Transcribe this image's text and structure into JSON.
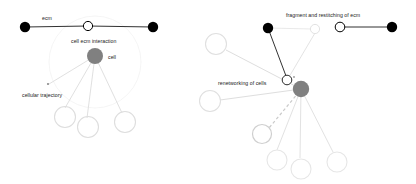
{
  "figure": {
    "title": "",
    "background_color": "#ffffff",
    "panels": [
      {
        "id": "left-panel",
        "name": "cell-ecm-interaction-panel",
        "labels": {
          "ecm": "ecm",
          "cell_ecm_interaction": "cell ecm interaction",
          "cell": "cell",
          "cellular_trajectory": "cellular trajectory"
        },
        "colors": {
          "ecm_node_filled": "#000000",
          "ecm_node_open": "#ffffff",
          "ecm_node_stroke": "#000000",
          "cell_node": "#808080",
          "trajectory_line": "#d8d8d8",
          "trajectory_node": "#d8d8d8",
          "halo": "#f0f0f0",
          "ecm_link": "#1a1a1a"
        },
        "nodes": {
          "ecm_left": {
            "x": 25,
            "y": 27,
            "r": 5.2,
            "type": "filled"
          },
          "ecm_mid": {
            "x": 88,
            "y": 26,
            "r": 4.6,
            "type": "open"
          },
          "ecm_right": {
            "x": 153,
            "y": 27,
            "r": 5.2,
            "type": "filled"
          },
          "cell": {
            "x": 95,
            "y": 56,
            "r": 8.0,
            "type": "cell"
          },
          "traj_1": {
            "x": 49,
            "y": 84,
            "r": 1.2,
            "type": "tiny"
          },
          "traj_2": {
            "x": 65,
            "y": 117,
            "r": 10.5,
            "type": "open-faint"
          },
          "traj_3": {
            "x": 87,
            "y": 127,
            "r": 10.5,
            "type": "open-faint"
          },
          "traj_4": {
            "x": 124,
            "y": 122,
            "r": 10.5,
            "type": "open-faint"
          }
        },
        "halo": {
          "x": 95,
          "y": 62,
          "r": 46
        },
        "edges": [
          {
            "from": "ecm_left",
            "to": "ecm_mid",
            "style": "solid-dark"
          },
          {
            "from": "ecm_mid",
            "to": "ecm_right",
            "style": "solid-dark"
          },
          {
            "from": "cell",
            "to": "traj_1",
            "style": "solid-faint"
          },
          {
            "from": "cell",
            "to": "traj_2",
            "style": "solid-faint"
          },
          {
            "from": "cell",
            "to": "traj_3",
            "style": "solid-faint"
          },
          {
            "from": "cell",
            "to": "traj_4",
            "style": "solid-faint"
          }
        ]
      },
      {
        "id": "right-panel",
        "name": "ecm-fragmentation-panel",
        "labels": {
          "fragment_and_restitching_of_ecm": "fragment and restitching of ecm",
          "renetworking_of_cells": "renetworking of cells"
        },
        "colors": {
          "ecm_node_filled": "#000000",
          "ecm_node_open": "#ffffff",
          "ecm_node_stroke": "#000000",
          "cell_node": "#808080",
          "trajectory_line": "#dcdcdc",
          "trajectory_node": "#dcdcdc",
          "ecm_link": "#1a1a1a",
          "dashed_link": "#c8c8c8"
        },
        "nodes": {
          "ecm_frag_filled": {
            "x": 268,
            "y": 28,
            "r": 5.2,
            "type": "filled"
          },
          "ecm_frag_open_faint": {
            "x": 315,
            "y": 29,
            "r": 4.6,
            "type": "open-faint"
          },
          "ecm_pair_open": {
            "x": 340,
            "y": 27,
            "r": 4.8,
            "type": "open"
          },
          "ecm_pair_filled": {
            "x": 392,
            "y": 27,
            "r": 5.2,
            "type": "filled"
          },
          "junction_open": {
            "x": 287,
            "y": 80,
            "r": 4.8,
            "type": "open"
          },
          "cell": {
            "x": 301,
            "y": 89,
            "r": 8.2,
            "type": "cell"
          },
          "net_far_1": {
            "x": 216,
            "y": 44,
            "r": 10.5,
            "type": "open-faint"
          },
          "net_far_2": {
            "x": 210,
            "y": 100,
            "r": 10.5,
            "type": "open-faint"
          },
          "net_dash": {
            "x": 262,
            "y": 134,
            "r": 9.5,
            "type": "open-mid"
          },
          "net_low_1": {
            "x": 276,
            "y": 160,
            "r": 10.0,
            "type": "open-faint"
          },
          "net_low_2": {
            "x": 300,
            "y": 168,
            "r": 10.0,
            "type": "open-faint"
          },
          "net_low_3": {
            "x": 336,
            "y": 162,
            "r": 10.0,
            "type": "open-faint"
          }
        },
        "edges": [
          {
            "from": "ecm_pair_open",
            "to": "ecm_pair_filled",
            "style": "solid-dark"
          },
          {
            "from": "ecm_frag_filled",
            "to": "junction_open",
            "style": "solid-dark"
          },
          {
            "from": "ecm_frag_open_faint",
            "to": "junction_open",
            "style": "solid-faint"
          },
          {
            "from": "ecm_frag_filled",
            "to": "ecm_frag_open_faint",
            "style": "solid-faint"
          },
          {
            "from": "cell",
            "to": "net_far_1",
            "style": "solid-faint"
          },
          {
            "from": "cell",
            "to": "net_far_2",
            "style": "solid-faint"
          },
          {
            "from": "cell",
            "to": "net_dash",
            "style": "dashed-faint"
          },
          {
            "from": "cell",
            "to": "net_low_1",
            "style": "solid-faint"
          },
          {
            "from": "cell",
            "to": "net_low_2",
            "style": "solid-faint"
          },
          {
            "from": "cell",
            "to": "net_low_3",
            "style": "solid-faint"
          }
        ]
      }
    ]
  }
}
